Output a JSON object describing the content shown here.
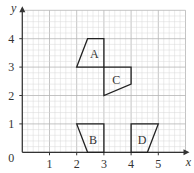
{
  "axes": {
    "x_label": "x",
    "y_label": "y",
    "origin_label": "0",
    "x_ticks": [
      "1",
      "2",
      "3",
      "4",
      "5"
    ],
    "y_ticks": [
      "1",
      "2",
      "3",
      "4"
    ],
    "x_range": [
      0,
      6
    ],
    "y_range": [
      0,
      5
    ],
    "minor_step": 0.2
  },
  "shapes": [
    {
      "label": "A",
      "points": [
        [
          2,
          3
        ],
        [
          2.4,
          4
        ],
        [
          3,
          4
        ],
        [
          3,
          3
        ]
      ],
      "label_pos": [
        2.65,
        3.45
      ]
    },
    {
      "label": "B",
      "points": [
        [
          2,
          1
        ],
        [
          3,
          1
        ],
        [
          3,
          0
        ],
        [
          2.4,
          0
        ]
      ],
      "label_pos": [
        2.6,
        0.45
      ]
    },
    {
      "label": "C",
      "points": [
        [
          3,
          3
        ],
        [
          4,
          3
        ],
        [
          4,
          2.4
        ],
        [
          3,
          2
        ]
      ],
      "label_pos": [
        3.45,
        2.55
      ]
    },
    {
      "label": "D",
      "points": [
        [
          4,
          1
        ],
        [
          5,
          1
        ],
        [
          4.6,
          0
        ],
        [
          4,
          0
        ]
      ],
      "label_pos": [
        4.4,
        0.45
      ]
    }
  ],
  "colors": {
    "grid_minor": "#d9d9d9",
    "grid_major": "#b5b5b5",
    "axis": "#333333",
    "shape_stroke": "#222222"
  }
}
